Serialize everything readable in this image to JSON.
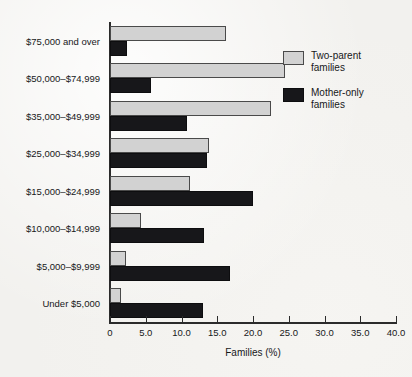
{
  "chart_data": {
    "type": "bar",
    "orientation": "horizontal",
    "title": "",
    "xlabel": "Families (%)",
    "ylabel": "",
    "xlim": [
      0,
      40
    ],
    "xticks": [
      "0",
      "5.0",
      "10.0",
      "15.0",
      "20.0",
      "25.0",
      "30.0",
      "35.0",
      "40.0"
    ],
    "xtick_values": [
      0,
      5,
      10,
      15,
      20,
      25,
      30,
      35,
      40
    ],
    "grid": false,
    "legend_position": "upper right",
    "categories": [
      "$75,000 and over",
      "$50,000–$74,999",
      "$35,000–$49,999",
      "$25,000–$34,999",
      "$15,000–$24,999",
      "$10,000–$14,999",
      "$5,000–$9,999",
      "Under $5,000"
    ],
    "series": [
      {
        "name": "Two-parent families",
        "legend_label_lines": [
          "Two-parent",
          "families"
        ],
        "color": "#d2d2d2",
        "values": [
          16.2,
          24.5,
          22.5,
          13.8,
          11.2,
          4.4,
          2.3,
          1.5
        ]
      },
      {
        "name": "Mother-only families",
        "legend_label_lines": [
          "Mother-only",
          "families"
        ],
        "color": "#17171a",
        "values": [
          2.4,
          5.8,
          10.8,
          13.5,
          20.0,
          13.1,
          16.8,
          13.0
        ]
      }
    ]
  },
  "colors": {
    "background": "#f2f1ee",
    "axis": "#2b2b2b",
    "text": "#17181a",
    "two_parent": "#d2d2d2",
    "mother_only": "#17171a"
  }
}
